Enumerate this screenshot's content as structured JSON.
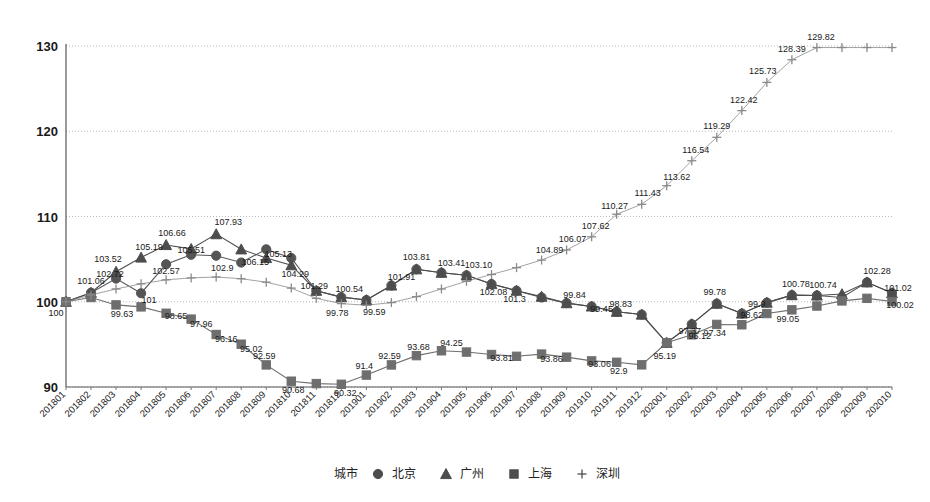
{
  "chart_data": {
    "type": "line",
    "title": "",
    "xlabel": "",
    "ylabel": "",
    "ylim": [
      90,
      130
    ],
    "yticks": [
      90,
      100,
      110,
      120,
      130
    ],
    "grid": true,
    "legend_position": "bottom",
    "legend_title": "城市",
    "categories": [
      "201801",
      "201802",
      "201803",
      "201804",
      "201805",
      "201806",
      "201807",
      "201808",
      "201809",
      "201810",
      "201811",
      "201812",
      "201901",
      "201902",
      "201903",
      "201904",
      "201905",
      "201906",
      "201907",
      "201908",
      "201909",
      "201910",
      "201911",
      "201912",
      "202001",
      "202002",
      "202003",
      "202004",
      "202005",
      "202006",
      "202007",
      "202008",
      "202009",
      "202010"
    ],
    "series": [
      {
        "name": "北京",
        "marker": "circle",
        "color": "#555555",
        "values": [
          100,
          101.06,
          102.72,
          101,
          104.4,
          105.51,
          105.4,
          104.6,
          106.15,
          105.13,
          101.29,
          100.54,
          100.2,
          101.91,
          103.81,
          103.41,
          103.1,
          102.08,
          101.3,
          100.5,
          99.84,
          99.45,
          98.83,
          98.5,
          95.19,
          97.37,
          99.78,
          98.62,
          99.9,
          100.78,
          100.74,
          100.5,
          102.28,
          101.02
        ]
      },
      {
        "name": "广州",
        "marker": "triangle",
        "color": "#4d4d4d",
        "values": [
          100,
          101.06,
          103.52,
          105.19,
          106.66,
          106.2,
          107.93,
          106.15,
          105.13,
          104.29,
          101.29,
          100.54,
          100.2,
          101.91,
          103.81,
          103.41,
          103.1,
          102.08,
          101.3,
          100.6,
          99.84,
          99.45,
          98.83,
          98.5,
          95.19,
          97.37,
          99.78,
          98.62,
          99.9,
          100.78,
          100.74,
          100.9,
          102.28,
          101.02
        ]
      },
      {
        "name": "上海",
        "marker": "square",
        "color": "#6e6e6e",
        "values": [
          100,
          100.5,
          99.63,
          99.4,
          98.65,
          97.96,
          96.16,
          95.02,
          92.59,
          90.68,
          90.4,
          90.32,
          91.4,
          92.59,
          93.68,
          94.25,
          94.1,
          93.81,
          93.6,
          93.86,
          93.5,
          93.06,
          92.9,
          92.6,
          95.19,
          96.12,
          97.34,
          97.3,
          98.62,
          99.05,
          99.5,
          100.1,
          100.4,
          100.02
        ]
      },
      {
        "name": "深圳",
        "marker": "plus",
        "color": "#8a8a8a",
        "values": [
          100,
          100.8,
          101.5,
          102.1,
          102.57,
          102.8,
          102.9,
          102.7,
          102.3,
          101.6,
          100.4,
          99.78,
          99.59,
          99.9,
          100.6,
          101.5,
          102.4,
          103.2,
          104.0,
          104.89,
          106.07,
          107.62,
          110.27,
          111.43,
          113.62,
          116.54,
          119.29,
          122.42,
          125.73,
          128.39,
          129.82,
          129.82,
          129.82,
          129.82
        ]
      }
    ],
    "point_labels": [
      {
        "series": "北京",
        "index": 0,
        "text": "100",
        "dx": -10,
        "dy": 14
      },
      {
        "series": "北京",
        "index": 1,
        "text": "101.06",
        "dx": 0,
        "dy": -9
      },
      {
        "series": "广州",
        "index": 2,
        "text": "103.52",
        "dx": -8,
        "dy": -10
      },
      {
        "series": "北京",
        "index": 2,
        "text": "102.72",
        "dx": -6,
        "dy": -2
      },
      {
        "series": "北京",
        "index": 3,
        "text": "101",
        "dx": 8,
        "dy": 10
      },
      {
        "series": "广州",
        "index": 3,
        "text": "105.19",
        "dx": 8,
        "dy": -8
      },
      {
        "series": "广州",
        "index": 4,
        "text": "106.66",
        "dx": 6,
        "dy": -9
      },
      {
        "series": "北京",
        "index": 5,
        "text": "105.51",
        "dx": 0,
        "dy": -2
      },
      {
        "series": "广州",
        "index": 6,
        "text": "107.93",
        "dx": 12,
        "dy": -9
      },
      {
        "series": "北京",
        "index": 7,
        "text": "106.15",
        "dx": 14,
        "dy": 2
      },
      {
        "series": "北京",
        "index": 8,
        "text": "105.13",
        "dx": 12,
        "dy": 8
      },
      {
        "series": "广州",
        "index": 9,
        "text": "104.29",
        "dx": 4,
        "dy": 12
      },
      {
        "series": "北京",
        "index": 10,
        "text": "101.29",
        "dx": -2,
        "dy": -2
      },
      {
        "series": "北京",
        "index": 11,
        "text": "100.54",
        "dx": 8,
        "dy": -5
      },
      {
        "series": "北京",
        "index": 13,
        "text": "101.91",
        "dx": 10,
        "dy": -5
      },
      {
        "series": "北京",
        "index": 14,
        "text": "103.81",
        "dx": 0,
        "dy": -9
      },
      {
        "series": "北京",
        "index": 15,
        "text": "103.41",
        "dx": 10,
        "dy": -7
      },
      {
        "series": "北京",
        "index": 16,
        "text": "103.10",
        "dx": 12,
        "dy": -7
      },
      {
        "series": "北京",
        "index": 17,
        "text": "102.08",
        "dx": 2,
        "dy": 11
      },
      {
        "series": "北京",
        "index": 18,
        "text": "101.3",
        "dx": -2,
        "dy": 11
      },
      {
        "series": "北京",
        "index": 20,
        "text": "99.84",
        "dx": 8,
        "dy": -5
      },
      {
        "series": "北京",
        "index": 21,
        "text": "99.45",
        "dx": 10,
        "dy": 6
      },
      {
        "series": "北京",
        "index": 22,
        "text": "98.83",
        "dx": 4,
        "dy": -5
      },
      {
        "series": "北京",
        "index": 24,
        "text": "95.19",
        "dx": -2,
        "dy": 16
      },
      {
        "series": "北京",
        "index": 25,
        "text": "97.37",
        "dx": -2,
        "dy": 10
      },
      {
        "series": "北京",
        "index": 26,
        "text": "99.78",
        "dx": -2,
        "dy": -9
      },
      {
        "series": "北京",
        "index": 27,
        "text": "98.62",
        "dx": 10,
        "dy": 4
      },
      {
        "series": "北京",
        "index": 28,
        "text": "99.9",
        "dx": -10,
        "dy": 4
      },
      {
        "series": "北京",
        "index": 29,
        "text": "100.78",
        "dx": 4,
        "dy": -8
      },
      {
        "series": "北京",
        "index": 30,
        "text": "100.74",
        "dx": 6,
        "dy": -7
      },
      {
        "series": "北京",
        "index": 32,
        "text": "102.28",
        "dx": 10,
        "dy": -8
      },
      {
        "series": "北京",
        "index": 33,
        "text": "101.02",
        "dx": 6,
        "dy": -2
      },
      {
        "series": "上海",
        "index": 2,
        "text": "99.63",
        "dx": 6,
        "dy": 12
      },
      {
        "series": "上海",
        "index": 4,
        "text": "98.65",
        "dx": 10,
        "dy": 6
      },
      {
        "series": "上海",
        "index": 5,
        "text": "97.96",
        "dx": 10,
        "dy": 8
      },
      {
        "series": "上海",
        "index": 6,
        "text": "96.16",
        "dx": 10,
        "dy": 8
      },
      {
        "series": "上海",
        "index": 7,
        "text": "95.02",
        "dx": 10,
        "dy": 8
      },
      {
        "series": "上海",
        "index": 8,
        "text": "92.59",
        "dx": -2,
        "dy": -6
      },
      {
        "series": "上海",
        "index": 9,
        "text": "90.68",
        "dx": 2,
        "dy": 12
      },
      {
        "series": "上海",
        "index": 11,
        "text": "90.32",
        "dx": 4,
        "dy": 12
      },
      {
        "series": "上海",
        "index": 12,
        "text": "91.4",
        "dx": -2,
        "dy": -6
      },
      {
        "series": "上海",
        "index": 13,
        "text": "92.59",
        "dx": -2,
        "dy": -6
      },
      {
        "series": "上海",
        "index": 14,
        "text": "93.68",
        "dx": 2,
        "dy": -6
      },
      {
        "series": "上海",
        "index": 15,
        "text": "94.25",
        "dx": 10,
        "dy": -5
      },
      {
        "series": "上海",
        "index": 17,
        "text": "93.81",
        "dx": 10,
        "dy": 6
      },
      {
        "series": "上海",
        "index": 19,
        "text": "93.86",
        "dx": 10,
        "dy": 8
      },
      {
        "series": "上海",
        "index": 21,
        "text": "93.06",
        "dx": 8,
        "dy": 6
      },
      {
        "series": "上海",
        "index": 22,
        "text": "92.9",
        "dx": 2,
        "dy": 12
      },
      {
        "series": "上海",
        "index": 25,
        "text": "96.12",
        "dx": 8,
        "dy": 4
      },
      {
        "series": "上海",
        "index": 26,
        "text": "97.34",
        "dx": -2,
        "dy": 12
      },
      {
        "series": "上海",
        "index": 29,
        "text": "99.05",
        "dx": -4,
        "dy": 12
      },
      {
        "series": "上海",
        "index": 33,
        "text": "100.02",
        "dx": 8,
        "dy": 6
      },
      {
        "series": "深圳",
        "index": 4,
        "text": "102.57",
        "dx": 0,
        "dy": -6
      },
      {
        "series": "深圳",
        "index": 6,
        "text": "102.9",
        "dx": 6,
        "dy": -6
      },
      {
        "series": "深圳",
        "index": 11,
        "text": "99.78",
        "dx": -4,
        "dy": 12
      },
      {
        "series": "深圳",
        "index": 12,
        "text": "99.59",
        "dx": 8,
        "dy": 10
      },
      {
        "series": "深圳",
        "index": 19,
        "text": "104.89",
        "dx": 8,
        "dy": -7
      },
      {
        "series": "深圳",
        "index": 20,
        "text": "106.07",
        "dx": 6,
        "dy": -8
      },
      {
        "series": "深圳",
        "index": 21,
        "text": "107.62",
        "dx": 4,
        "dy": -8
      },
      {
        "series": "深圳",
        "index": 22,
        "text": "110.27",
        "dx": -2,
        "dy": -5
      },
      {
        "series": "深圳",
        "index": 23,
        "text": "111.43",
        "dx": 6,
        "dy": -8
      },
      {
        "series": "深圳",
        "index": 24,
        "text": "113.62",
        "dx": 10,
        "dy": -6
      },
      {
        "series": "深圳",
        "index": 25,
        "text": "116.54",
        "dx": 4,
        "dy": -8
      },
      {
        "series": "深圳",
        "index": 26,
        "text": "119.29",
        "dx": 0,
        "dy": -8
      },
      {
        "series": "深圳",
        "index": 27,
        "text": "122.42",
        "dx": 2,
        "dy": -8
      },
      {
        "series": "深圳",
        "index": 28,
        "text": "125.73",
        "dx": -4,
        "dy": -8
      },
      {
        "series": "深圳",
        "index": 29,
        "text": "128.39",
        "dx": 0,
        "dy": -8
      },
      {
        "series": "深圳",
        "index": 30,
        "text": "129.82",
        "dx": 4,
        "dy": -8
      }
    ]
  },
  "legend": {
    "title": "城市",
    "entries": [
      {
        "label": "北京",
        "marker": "circle"
      },
      {
        "label": "广州",
        "marker": "triangle"
      },
      {
        "label": "上海",
        "marker": "square"
      },
      {
        "label": "深圳",
        "marker": "plus"
      }
    ]
  }
}
